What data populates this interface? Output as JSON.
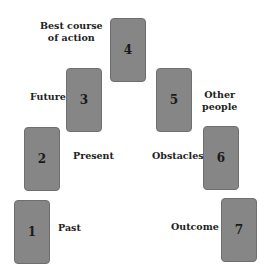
{
  "diagram": {
    "type": "seven-card spread",
    "card_color": "#868686",
    "cards": [
      {
        "number": "1",
        "label": "Past"
      },
      {
        "number": "2",
        "label": "Present"
      },
      {
        "number": "3",
        "label": "Future"
      },
      {
        "number": "4",
        "label_line1": "Best course",
        "label_line2": "of action"
      },
      {
        "number": "5",
        "label_line1": "Other",
        "label_line2": "people"
      },
      {
        "number": "6",
        "label": "Obstacles"
      },
      {
        "number": "7",
        "label": "Outcome"
      }
    ]
  }
}
